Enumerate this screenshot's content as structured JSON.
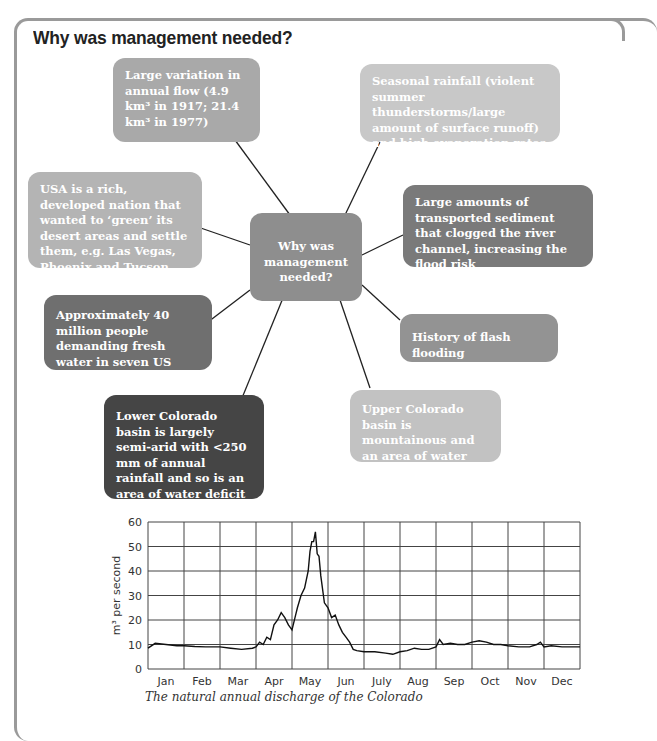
{
  "header": {
    "title": "Why was management needed?"
  },
  "center": {
    "label": "Why was management needed?",
    "color": "#8e8e8e"
  },
  "boxes": [
    {
      "id": "annual-flow",
      "text": "Large variation in annual flow (4.9 km³ in 1917; 21.4 km³ in 1977)",
      "color": "#a9a9a9"
    },
    {
      "id": "seasonal-rainfall",
      "text": "Seasonal rainfall (violent summer thunderstorms/large amount of surface runoff) and high evaporation rates",
      "color": "#c8c8c8"
    },
    {
      "id": "rich-nation",
      "text": "USA is a rich, developed nation that wanted to ‘green’ its desert areas and settle them, e.g. Las Vegas, Phoenix and Tucson",
      "color": "#b4b4b4"
    },
    {
      "id": "sediment",
      "text": "Large amounts of transported sediment that clogged the river channel, increasing the flood risk",
      "color": "#7a7a7a"
    },
    {
      "id": "population",
      "text": "Approximately 40 million people demanding fresh water in seven US states",
      "color": "#6f6f6f"
    },
    {
      "id": "flash-flooding",
      "text": "History of flash flooding",
      "color": "#939393"
    },
    {
      "id": "lower-basin",
      "text": "Lower Colorado basin is largely semi-arid with <250 mm of annual rainfall and so is an area of water deficit",
      "color": "#454545"
    },
    {
      "id": "upper-basin",
      "text": "Upper Colorado basin is mountainous and an area of water surplus",
      "color": "#c2c2c2"
    }
  ],
  "chart_data": {
    "type": "line",
    "title": "",
    "caption": "The natural annual discharge of the Colorado",
    "xlabel": "",
    "ylabel": "m³ per second",
    "ylim": [
      0,
      60
    ],
    "yticks": [
      0,
      10,
      20,
      30,
      40,
      50,
      60
    ],
    "categories": [
      "Jan",
      "Feb",
      "Mar",
      "Apr",
      "May",
      "Jun",
      "July",
      "Aug",
      "Sep",
      "Oct",
      "Nov",
      "Dec"
    ],
    "grid": true,
    "series": [
      {
        "name": "Discharge",
        "x": [
          0,
          0.2,
          0.5,
          0.8,
          1.0,
          1.3,
          1.6,
          2.0,
          2.3,
          2.6,
          2.9,
          3.0,
          3.1,
          3.2,
          3.3,
          3.4,
          3.5,
          3.6,
          3.7,
          3.75,
          3.8,
          3.9,
          4.0,
          4.1,
          4.15,
          4.25,
          4.35,
          4.45,
          4.5,
          4.55,
          4.6,
          4.65,
          4.7,
          4.75,
          4.8,
          4.9,
          5.0,
          5.1,
          5.2,
          5.3,
          5.4,
          5.5,
          5.6,
          5.7,
          5.8,
          6.0,
          6.3,
          6.6,
          6.8,
          7.0,
          7.2,
          7.4,
          7.6,
          7.8,
          8.0,
          8.1,
          8.2,
          8.4,
          8.6,
          8.8,
          9.0,
          9.2,
          9.4,
          9.6,
          9.8,
          10.0,
          10.3,
          10.6,
          10.8,
          10.9,
          11.0,
          11.2,
          11.5,
          12.0
        ],
        "values": [
          8.5,
          10.5,
          10,
          9.5,
          9.5,
          9.2,
          9,
          9,
          8.5,
          8,
          8.5,
          9,
          11,
          10,
          13,
          12,
          18,
          20,
          23,
          22,
          21,
          18,
          16,
          22,
          25,
          30,
          33,
          40,
          48,
          52,
          52,
          56,
          47,
          46,
          38,
          27,
          25,
          21,
          22,
          18,
          15,
          13,
          11,
          8,
          7.5,
          7,
          7,
          6.5,
          6,
          7,
          7.5,
          8.5,
          8,
          8,
          9,
          12,
          10,
          10.5,
          10,
          10,
          11,
          11.5,
          11,
          10,
          10,
          9.5,
          9,
          9,
          10,
          11,
          9,
          9.5,
          9,
          9
        ]
      }
    ]
  }
}
